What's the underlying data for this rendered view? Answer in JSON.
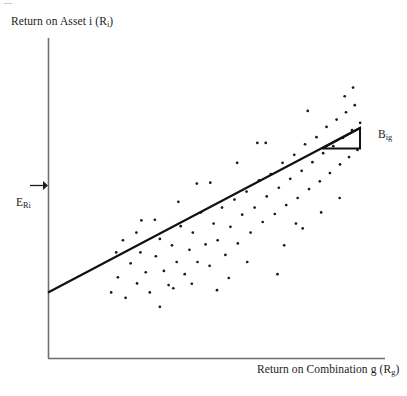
{
  "figure": {
    "background_color": "#ffffff",
    "width": 407,
    "height": 396
  },
  "labels": {
    "y_axis_main": "Return on Asset i (R",
    "y_axis_sub": "i",
    "y_axis_close": ")",
    "x_axis_main": "Return on Combination g (R",
    "x_axis_sub": "g",
    "x_axis_close": ")",
    "expected_return_main": "E",
    "expected_return_sub": "Ri",
    "beta_main": "B",
    "beta_sub": "ig"
  },
  "chart_data": {
    "type": "scatter",
    "title": "",
    "xlabel": "Return on Combination g (Rg)",
    "ylabel": "Return on Asset i (Ri)",
    "grid": false,
    "legend": false,
    "axis_style": "two-axis L-frame, no tick marks, no numeric tick labels",
    "xlim": [
      0,
      1
    ],
    "ylim": [
      0,
      1
    ],
    "annotations": [
      {
        "name": "expected-return-marker",
        "text": "E_Ri",
        "type": "arrow-to-y-axis",
        "arrow_from_x": 0.055,
        "arrow_to_x": 0.115,
        "y": 0.435
      },
      {
        "name": "beta-slope-triangle",
        "text": "B_ig",
        "type": "right-triangle-on-line",
        "hypotenuse_from": [
          0.815,
          0.285
        ],
        "hypotenuse_to": [
          0.925,
          0.185
        ],
        "vertical_leg_x": 0.925,
        "horizontal_leg_y": 0.285
      }
    ],
    "regression_line": {
      "name": "characteristic-line",
      "x_start": 0.0,
      "y_start": 0.205,
      "x_end": 0.925,
      "y_end": 0.718,
      "color": "#111111"
    },
    "series": [
      {
        "name": "asset-returns",
        "marker": "point",
        "color": "#1a1a1a",
        "points": [
          [
            0.185,
            0.205
          ],
          [
            0.205,
            0.252
          ],
          [
            0.228,
            0.188
          ],
          [
            0.243,
            0.296
          ],
          [
            0.262,
            0.233
          ],
          [
            0.272,
            0.33
          ],
          [
            0.288,
            0.268
          ],
          [
            0.3,
            0.205
          ],
          [
            0.318,
            0.318
          ],
          [
            0.33,
            0.372
          ],
          [
            0.342,
            0.272
          ],
          [
            0.356,
            0.228
          ],
          [
            0.366,
            0.352
          ],
          [
            0.38,
            0.3
          ],
          [
            0.392,
            0.412
          ],
          [
            0.404,
            0.262
          ],
          [
            0.418,
            0.338
          ],
          [
            0.428,
            0.392
          ],
          [
            0.442,
            0.3
          ],
          [
            0.452,
            0.455
          ],
          [
            0.466,
            0.355
          ],
          [
            0.478,
            0.288
          ],
          [
            0.49,
            0.42
          ],
          [
            0.502,
            0.368
          ],
          [
            0.515,
            0.47
          ],
          [
            0.525,
            0.322
          ],
          [
            0.54,
            0.41
          ],
          [
            0.552,
            0.495
          ],
          [
            0.562,
            0.358
          ],
          [
            0.575,
            0.448
          ],
          [
            0.588,
            0.52
          ],
          [
            0.6,
            0.392
          ],
          [
            0.612,
            0.47
          ],
          [
            0.625,
            0.555
          ],
          [
            0.636,
            0.425
          ],
          [
            0.648,
            0.505
          ],
          [
            0.66,
            0.575
          ],
          [
            0.672,
            0.45
          ],
          [
            0.684,
            0.532
          ],
          [
            0.695,
            0.61
          ],
          [
            0.706,
            0.478
          ],
          [
            0.718,
            0.56
          ],
          [
            0.73,
            0.635
          ],
          [
            0.74,
            0.5
          ],
          [
            0.752,
            0.585
          ],
          [
            0.762,
            0.668
          ],
          [
            0.774,
            0.528
          ],
          [
            0.784,
            0.612
          ],
          [
            0.796,
            0.69
          ],
          [
            0.806,
            0.552
          ],
          [
            0.816,
            0.64
          ],
          [
            0.826,
            0.722
          ],
          [
            0.836,
            0.578
          ],
          [
            0.846,
            0.662
          ],
          [
            0.856,
            0.745
          ],
          [
            0.866,
            0.605
          ],
          [
            0.875,
            0.688
          ],
          [
            0.884,
            0.768
          ],
          [
            0.893,
            0.628
          ],
          [
            0.902,
            0.712
          ],
          [
            0.91,
            0.79
          ],
          [
            0.918,
            0.65
          ],
          [
            0.926,
            0.735
          ],
          [
            0.2,
            0.33
          ],
          [
            0.26,
            0.392
          ],
          [
            0.315,
            0.432
          ],
          [
            0.37,
            0.218
          ],
          [
            0.425,
            0.232
          ],
          [
            0.48,
            0.548
          ],
          [
            0.535,
            0.25
          ],
          [
            0.59,
            0.3
          ],
          [
            0.645,
            0.672
          ],
          [
            0.7,
            0.352
          ],
          [
            0.755,
            0.405
          ],
          [
            0.81,
            0.455
          ],
          [
            0.865,
            0.5
          ],
          [
            0.88,
            0.818
          ],
          [
            0.905,
            0.845
          ],
          [
            0.77,
            0.772
          ],
          [
            0.735,
            0.42
          ],
          [
            0.68,
            0.262
          ],
          [
            0.62,
            0.672
          ],
          [
            0.56,
            0.61
          ],
          [
            0.5,
            0.212
          ],
          [
            0.44,
            0.545
          ],
          [
            0.385,
            0.488
          ],
          [
            0.33,
            0.16
          ],
          [
            0.275,
            0.43
          ],
          [
            0.22,
            0.368
          ]
        ]
      }
    ]
  }
}
